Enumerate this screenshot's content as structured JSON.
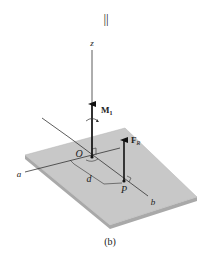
{
  "figure": {
    "equals_sign": "||",
    "caption": "(b)",
    "labels": {
      "z_axis": "z",
      "a_axis": "a",
      "b_axis": "b",
      "origin": "O",
      "point": "P",
      "distance": "d",
      "moment": "M",
      "moment_sub": "1",
      "force": "F",
      "force_sub": "R"
    },
    "colors": {
      "plate_top": "#c8c8c8",
      "plate_edge": "#a9a9a9",
      "line": "#333333",
      "background": "#ffffff"
    }
  }
}
